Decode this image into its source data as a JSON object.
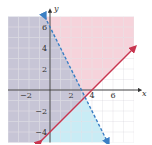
{
  "chart_data": {
    "type": "line",
    "title": "",
    "xlabel": "x",
    "ylabel": "y",
    "xlim": [
      -4,
      8
    ],
    "ylim": [
      -5,
      7
    ],
    "grid": true,
    "x_ticks": [
      -2,
      2,
      4,
      6
    ],
    "y_ticks": [
      6,
      4,
      2,
      -2,
      -4
    ],
    "series": [
      {
        "name": "boundary-red",
        "equation": "y = x - 4",
        "style": "solid",
        "color": "#c8354f",
        "points": [
          [
            -1,
            -5
          ],
          [
            8,
            4
          ]
        ],
        "arrow": "both"
      },
      {
        "name": "boundary-blue",
        "equation": "y = -2x + 6",
        "style": "dashed",
        "color": "#3b7fc4",
        "points": [
          [
            -0.5,
            7
          ],
          [
            5.5,
            -5
          ]
        ],
        "arrow": "both"
      }
    ],
    "regions": [
      {
        "name": "pink-region",
        "description": "y >= x - 4 (above/left of red line)",
        "color": "#f6d3db"
      },
      {
        "name": "blue-region",
        "description": "y < -2x + 6 (below/left of dashed line)",
        "color": "#c9ecf5"
      },
      {
        "name": "overlap-region",
        "description": "intersection of both half-planes",
        "color": "#c7c5d6"
      }
    ]
  },
  "labels": {
    "x_axis": "x",
    "y_axis": "y",
    "x_tick_labels": [
      "−2",
      "2",
      "4",
      "6"
    ],
    "y_tick_labels": [
      "6",
      "4",
      "2",
      "−2",
      "−4"
    ]
  }
}
